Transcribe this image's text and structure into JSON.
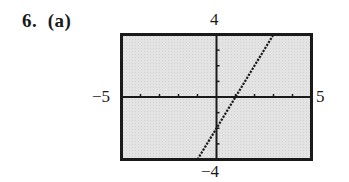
{
  "problem": {
    "label": "6.  (a)"
  },
  "window": {
    "xmin": -5,
    "xmax": 5,
    "ymin": -4,
    "ymax": 4,
    "xscl": 1,
    "yscl": 1,
    "labels": {
      "xmin": "−5",
      "xmax": "5",
      "ymin": "−4",
      "ymax": "4"
    }
  },
  "colors": {
    "screen_bg": "#e2e2e2",
    "ink": "#1a1a1a"
  },
  "chart_data": {
    "type": "line",
    "title": "6. (a)",
    "xlabel": "",
    "ylabel": "",
    "xlim": [
      -5,
      5
    ],
    "ylim": [
      -4,
      4
    ],
    "grid": false,
    "axis_ticks": {
      "x": [
        -5,
        -4,
        -3,
        -2,
        -1,
        0,
        1,
        2,
        3,
        4,
        5
      ],
      "y": [
        -4,
        -3,
        -2,
        -1,
        0,
        1,
        2,
        3,
        4
      ]
    },
    "tick_labels": {
      "x": [
        "−5",
        "5"
      ],
      "y": [
        "−4",
        "4"
      ]
    },
    "series": [
      {
        "name": "y = 2x - 2",
        "style": "dotted",
        "slope": 2,
        "intercept": -2,
        "x": [
          -1,
          0,
          1,
          2,
          3
        ],
        "y": [
          -4,
          -2,
          0,
          2,
          4
        ]
      }
    ],
    "annotations": {
      "x_intercept": 1,
      "y_intercept": -2
    }
  }
}
